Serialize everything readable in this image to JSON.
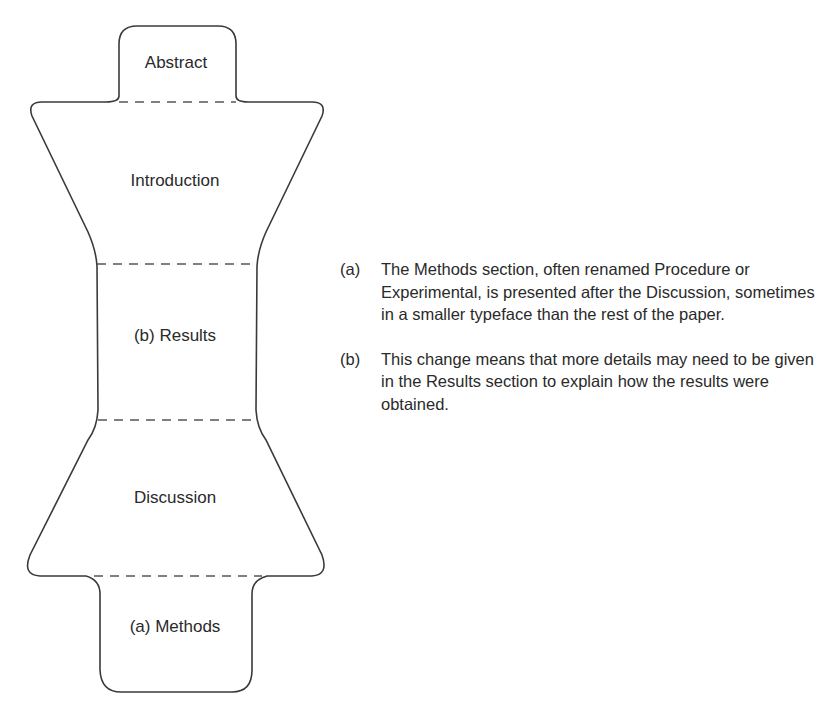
{
  "diagram": {
    "sections": [
      {
        "id": "abstract",
        "label": "Abstract"
      },
      {
        "id": "introduction",
        "label": "Introduction"
      },
      {
        "id": "results",
        "label": "(b) Results"
      },
      {
        "id": "discussion",
        "label": "Discussion"
      },
      {
        "id": "methods",
        "label": "(a) Methods"
      }
    ],
    "colors": {
      "stroke": "#3a3a3a",
      "dash": "#555555",
      "text": "#2a2a2a"
    }
  },
  "notes": [
    {
      "marker": "(a)",
      "text": "The Methods section, often renamed Procedure or Experimental, is presented after the Discussion, sometimes in a smaller typeface than the rest of the paper."
    },
    {
      "marker": "(b)",
      "text": "This change means that more details may need to be given in the Results section to explain how the results were obtained."
    }
  ]
}
